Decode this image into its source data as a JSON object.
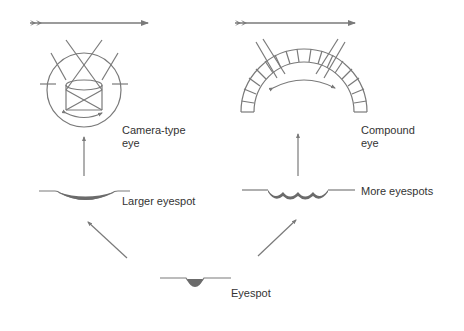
{
  "diagram": {
    "type": "evolutionary progression of eye complexity",
    "colors": {
      "line": "#7a7a7a",
      "pigment": "#6b6b6b",
      "text": "#333333",
      "background": "#ffffff"
    },
    "stages": [
      {
        "id": "eyespot",
        "label": "Eyespot"
      },
      {
        "id": "larger-eyespot",
        "label": "Larger eyespot"
      },
      {
        "id": "more-eyespots",
        "label": "More eyespots"
      },
      {
        "id": "camera-type-eye",
        "label": "Camera-type\neye"
      },
      {
        "id": "compound-eye",
        "label": "Compound\neye"
      }
    ],
    "timeline_arrows": [
      {
        "id": "left-lineage-arrow"
      },
      {
        "id": "right-lineage-arrow"
      }
    ]
  }
}
